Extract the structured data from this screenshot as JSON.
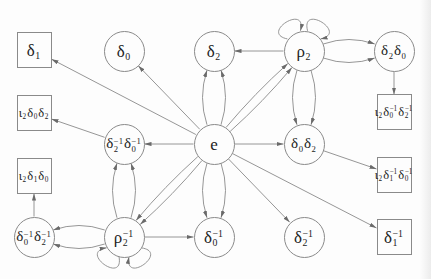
{
  "diagram": {
    "colors": {
      "background": "#fdfdfd",
      "stroke": "#8a8a8a",
      "arrow": "#6a6a6a",
      "text": "#222222"
    },
    "nodes": [
      {
        "id": "delta1",
        "shape": "box",
        "x": 34,
        "y": 50,
        "text": "δ₁",
        "tokens": [
          [
            "δ",
            "1",
            ""
          ]
        ]
      },
      {
        "id": "delta0",
        "shape": "circle",
        "x": 124,
        "y": 51,
        "text": "δ₀",
        "tokens": [
          [
            "δ",
            "0",
            ""
          ]
        ]
      },
      {
        "id": "delta2",
        "shape": "circle",
        "x": 214,
        "y": 51,
        "text": "δ₂",
        "tokens": [
          [
            "δ",
            "2",
            ""
          ]
        ]
      },
      {
        "id": "rho2",
        "shape": "circle",
        "x": 304,
        "y": 51,
        "text": "ρ₂",
        "tokens": [
          [
            "ρ",
            "2",
            ""
          ]
        ]
      },
      {
        "id": "delta2-delta0",
        "shape": "circle",
        "x": 394,
        "y": 51,
        "text": "δ₂δ₀",
        "tokens": [
          [
            "δ",
            "2",
            ""
          ],
          [
            "δ",
            "0",
            ""
          ]
        ]
      },
      {
        "id": "iota2-delta0-delta2",
        "shape": "box",
        "x": 34,
        "y": 113,
        "text": "ι₂δ₀δ₂",
        "tokens": [
          [
            "ι",
            "2",
            ""
          ],
          [
            "δ",
            "0",
            ""
          ],
          [
            "δ",
            "2",
            ""
          ]
        ]
      },
      {
        "id": "delta2inv-delta0inv",
        "shape": "circle",
        "x": 124,
        "y": 144,
        "text": "δ₂⁻¹δ₀⁻¹",
        "tokens": [
          [
            "δ",
            "2",
            "−1"
          ],
          [
            "δ",
            "0",
            "−1"
          ]
        ]
      },
      {
        "id": "e",
        "shape": "circle",
        "x": 214,
        "y": 144,
        "text": "e",
        "tokens": [
          [
            "e",
            "",
            ""
          ]
        ]
      },
      {
        "id": "delta0-delta2",
        "shape": "circle",
        "x": 304,
        "y": 144,
        "text": "δ₀δ₂",
        "tokens": [
          [
            "δ",
            "0",
            ""
          ],
          [
            "δ",
            "2",
            ""
          ]
        ]
      },
      {
        "id": "iota2-delta0inv-delta2inv",
        "shape": "box",
        "x": 394,
        "y": 112,
        "text": "ι₂δ₀⁻¹δ₂⁻¹",
        "tokens": [
          [
            "ι",
            "2",
            ""
          ],
          [
            "δ",
            "0",
            "−1"
          ],
          [
            "δ",
            "2",
            "−1"
          ]
        ]
      },
      {
        "id": "iota2-delta1-delta0",
        "shape": "box",
        "x": 34,
        "y": 176,
        "text": "ι₂δ₁δ₀",
        "tokens": [
          [
            "ι",
            "2",
            ""
          ],
          [
            "δ",
            "1",
            ""
          ],
          [
            "δ",
            "0",
            ""
          ]
        ]
      },
      {
        "id": "iota2-delta1inv-delta0inv",
        "shape": "box",
        "x": 394,
        "y": 175,
        "text": "ι₂δ₁⁻¹δ₀⁻¹",
        "tokens": [
          [
            "ι",
            "2",
            ""
          ],
          [
            "δ",
            "1",
            "−1"
          ],
          [
            "δ",
            "0",
            "−1"
          ]
        ]
      },
      {
        "id": "delta0inv-delta2inv",
        "shape": "circle",
        "x": 34,
        "y": 237,
        "text": "δ₀⁻¹δ₂⁻¹",
        "tokens": [
          [
            "δ",
            "0",
            "−1"
          ],
          [
            "δ",
            "2",
            "−1"
          ]
        ]
      },
      {
        "id": "rho2inv",
        "shape": "circle",
        "x": 124,
        "y": 237,
        "text": "ρ₂⁻¹",
        "tokens": [
          [
            "ρ",
            "2",
            "−1"
          ]
        ]
      },
      {
        "id": "delta0inv",
        "shape": "circle",
        "x": 214,
        "y": 237,
        "text": "δ₀⁻¹",
        "tokens": [
          [
            "δ",
            "0",
            "−1"
          ]
        ]
      },
      {
        "id": "delta2inv",
        "shape": "circle",
        "x": 304,
        "y": 237,
        "text": "δ₂⁻¹",
        "tokens": [
          [
            "δ",
            "2",
            "−1"
          ]
        ]
      },
      {
        "id": "delta1inv",
        "shape": "box",
        "x": 394,
        "y": 237,
        "text": "δ₁⁻¹",
        "tokens": [
          [
            "δ",
            "1",
            "−1"
          ]
        ]
      }
    ],
    "edges": [
      {
        "from": "e",
        "to": "delta1",
        "kind": "straight"
      },
      {
        "from": "e",
        "to": "delta0",
        "kind": "straight"
      },
      {
        "from": "e",
        "to": "delta2",
        "kind": "curve",
        "bend": 16,
        "spread": 20
      },
      {
        "from": "e",
        "to": "delta2",
        "kind": "curve",
        "bend": -16,
        "spread": 20
      },
      {
        "from": "e",
        "to": "rho2",
        "kind": "curve",
        "bend": 6,
        "spread": 8
      },
      {
        "from": "e",
        "to": "rho2",
        "kind": "curve",
        "bend": -6,
        "spread": 8
      },
      {
        "from": "rho2",
        "to": "delta2",
        "kind": "straight"
      },
      {
        "from": "rho2",
        "to": "delta2-delta0",
        "kind": "curve",
        "bend": 16,
        "spread": 20
      },
      {
        "from": "rho2",
        "to": "delta2-delta0",
        "kind": "curve",
        "bend": -16,
        "spread": 20
      },
      {
        "from": "rho2",
        "to": "rho2",
        "kind": "loop",
        "angle": -122
      },
      {
        "from": "rho2",
        "to": "rho2",
        "kind": "loop",
        "angle": -58
      },
      {
        "from": "rho2",
        "to": "delta0-delta2",
        "kind": "curve",
        "bend": 16,
        "spread": 20
      },
      {
        "from": "rho2",
        "to": "delta0-delta2",
        "kind": "curve",
        "bend": -16,
        "spread": 20
      },
      {
        "from": "delta2-delta0",
        "to": "iota2-delta0inv-delta2inv",
        "kind": "straight"
      },
      {
        "from": "e",
        "to": "delta0-delta2",
        "kind": "straight"
      },
      {
        "from": "delta0-delta2",
        "to": "iota2-delta1inv-delta0inv",
        "kind": "straight"
      },
      {
        "from": "e",
        "to": "delta2inv-delta0inv",
        "kind": "straight"
      },
      {
        "from": "delta2inv-delta0inv",
        "to": "iota2-delta0-delta2",
        "kind": "straight"
      },
      {
        "from": "rho2inv",
        "to": "delta2inv-delta0inv",
        "kind": "curve",
        "bend": 16,
        "spread": 20
      },
      {
        "from": "rho2inv",
        "to": "delta2inv-delta0inv",
        "kind": "curve",
        "bend": -16,
        "spread": 20
      },
      {
        "from": "rho2inv",
        "to": "delta0inv-delta2inv",
        "kind": "curve",
        "bend": 16,
        "spread": 20
      },
      {
        "from": "rho2inv",
        "to": "delta0inv-delta2inv",
        "kind": "curve",
        "bend": -16,
        "spread": 20
      },
      {
        "from": "delta0inv-delta2inv",
        "to": "iota2-delta1-delta0",
        "kind": "straight"
      },
      {
        "from": "rho2inv",
        "to": "rho2inv",
        "kind": "loop",
        "angle": 126
      },
      {
        "from": "rho2inv",
        "to": "rho2inv",
        "kind": "loop",
        "angle": 54
      },
      {
        "from": "e",
        "to": "rho2inv",
        "kind": "curve",
        "bend": 6,
        "spread": 8
      },
      {
        "from": "e",
        "to": "rho2inv",
        "kind": "curve",
        "bend": -6,
        "spread": 8
      },
      {
        "from": "rho2inv",
        "to": "delta0inv",
        "kind": "straight"
      },
      {
        "from": "e",
        "to": "delta0inv",
        "kind": "curve",
        "bend": 16,
        "spread": 20
      },
      {
        "from": "e",
        "to": "delta0inv",
        "kind": "curve",
        "bend": -16,
        "spread": 20
      },
      {
        "from": "e",
        "to": "delta2inv",
        "kind": "straight"
      },
      {
        "from": "e",
        "to": "delta1inv",
        "kind": "straight"
      }
    ]
  }
}
